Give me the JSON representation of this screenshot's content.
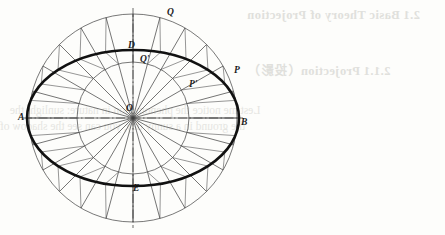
{
  "page": {
    "width": 445,
    "height": 235,
    "background_color": "#fdfdfb"
  },
  "showthrough_text": {
    "note": "faint mirrored text bleeding through from the reverse side of the scanned page",
    "color": "#c9c9c4",
    "heading_1": "2.1  Basic Theory of Projection",
    "heading_2": "2.1.1   Projection（投影）",
    "body_line_1": "Lest me notice the phenomenon in nature:  sunlight   the",
    "body_line_2": "the ground in a sunny day, you can see the shadow of"
  },
  "figure": {
    "center": {
      "x": 133,
      "y": 118,
      "label": "O"
    },
    "outer_circle": {
      "radius": 104,
      "stroke": "#555555",
      "stroke_width": 0.8,
      "label": "outer-circle"
    },
    "inner_circle": {
      "radius": 56,
      "stroke": "#555555",
      "stroke_width": 0.8,
      "label": "inner-circle"
    },
    "ellipse": {
      "semi_major_x": 106,
      "semi_minor_y": 68,
      "stroke": "#111111",
      "stroke_width": 2.6,
      "label": "constructed-ellipse"
    },
    "spoke_count": 24,
    "spoke_angle_step_degrees": 15,
    "spoke_stroke": "#3a3a3a",
    "construction_line_stroke": "#6a6a6a",
    "axis_line_style": "dash-dot",
    "axis_stroke": "#444444",
    "labels": [
      {
        "id": "A",
        "text": "A",
        "x": 18,
        "y": 113,
        "role": "left end of major axis"
      },
      {
        "id": "B",
        "text": "B",
        "x": 241,
        "y": 118,
        "role": "right end of major axis"
      },
      {
        "id": "D",
        "text": "D",
        "x": 128,
        "y": 41,
        "role": "top end of minor axis"
      },
      {
        "id": "E",
        "text": "E",
        "x": 133,
        "y": 184,
        "role": "bottom end of minor axis"
      },
      {
        "id": "O",
        "text": "O",
        "x": 126,
        "y": 104,
        "role": "center"
      },
      {
        "id": "P",
        "text": "P",
        "x": 234,
        "y": 66,
        "role": "point on outer circle"
      },
      {
        "id": "Pp",
        "text": "P'",
        "x": 189,
        "y": 80,
        "role": "projected point on ellipse"
      },
      {
        "id": "Q",
        "text": "Q",
        "x": 167,
        "y": 8,
        "role": "point on outer circle"
      },
      {
        "id": "Qp",
        "text": "Q'",
        "x": 140,
        "y": 55,
        "role": "projected point on ellipse"
      }
    ]
  }
}
